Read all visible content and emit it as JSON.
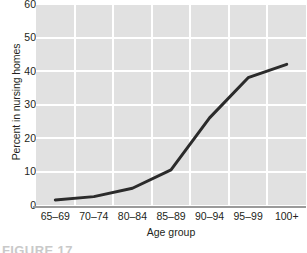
{
  "chart_data": {
    "type": "line",
    "title": "",
    "xlabel": "Age group",
    "ylabel": "Percent in nursing homes",
    "categories": [
      "65–69",
      "70–74",
      "80–84",
      "85–89",
      "90–94",
      "95–99",
      "100+"
    ],
    "values": [
      1.5,
      2.5,
      5,
      10.5,
      26,
      38,
      42
    ],
    "ylim": [
      0,
      60
    ],
    "yticks": [
      0,
      10,
      20,
      30,
      40,
      50,
      60
    ],
    "ytick_labels": [
      "0",
      "10",
      "20",
      "30",
      "40",
      "50",
      "60"
    ],
    "grid": true,
    "legend": false,
    "series": [
      {
        "name": "Percent in nursing homes",
        "values": [
          1.5,
          2.5,
          5,
          10.5,
          26,
          38,
          42
        ],
        "color": "#2b2b2b",
        "line_width": 3
      }
    ],
    "plot_background": "#e1e1e1",
    "gridline_color": "#ffffff",
    "axis_line_color": "#9a9a9a",
    "text_color": "#231f20"
  },
  "caption": {
    "text": "FIGURE 17"
  }
}
